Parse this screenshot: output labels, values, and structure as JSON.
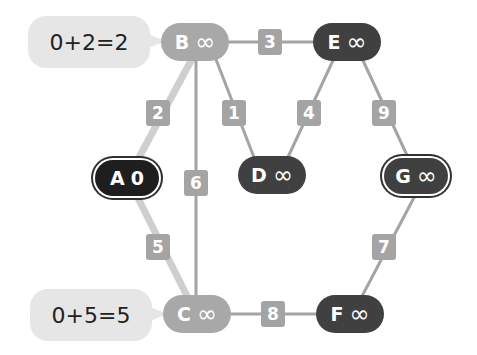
{
  "colors": {
    "light_node": "#a8a8a8",
    "dark_node": "#404040",
    "start_node": "#1e1e1e",
    "edge": "#a4a4a4",
    "edge_highlight": "#cfcfcf",
    "bubble": "#e6e6e6"
  },
  "nodes": {
    "A": {
      "label": "A",
      "value": "0"
    },
    "B": {
      "label": "B",
      "value": "∞"
    },
    "C": {
      "label": "C",
      "value": "∞"
    },
    "D": {
      "label": "D",
      "value": "∞"
    },
    "E": {
      "label": "E",
      "value": "∞"
    },
    "F": {
      "label": "F",
      "value": "∞"
    },
    "G": {
      "label": "G",
      "value": "∞"
    }
  },
  "edges": [
    {
      "from": "A",
      "to": "B",
      "weight": "2"
    },
    {
      "from": "A",
      "to": "C",
      "weight": "5"
    },
    {
      "from": "B",
      "to": "C",
      "weight": "6"
    },
    {
      "from": "B",
      "to": "D",
      "weight": "1"
    },
    {
      "from": "B",
      "to": "E",
      "weight": "3"
    },
    {
      "from": "E",
      "to": "D",
      "weight": "4"
    },
    {
      "from": "E",
      "to": "G",
      "weight": "9"
    },
    {
      "from": "C",
      "to": "F",
      "weight": "8"
    },
    {
      "from": "G",
      "to": "F",
      "weight": "7"
    }
  ],
  "bubbles": {
    "B": "0+2=2",
    "C": "0+5=5"
  }
}
